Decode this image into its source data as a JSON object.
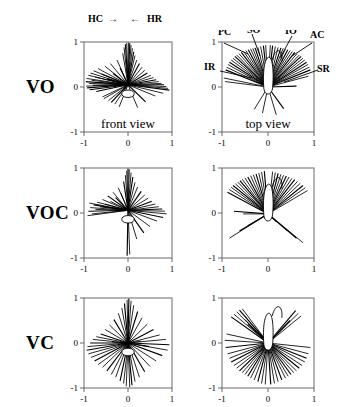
{
  "figure": {
    "rows": [
      {
        "label": "VO"
      },
      {
        "label": "VOC"
      },
      {
        "label": "VC"
      }
    ],
    "view_labels": {
      "front": "front view",
      "top": "top view"
    },
    "axis": {
      "tick_min": "-1",
      "tick_mid": "0",
      "tick_max": "1",
      "range": [
        -1,
        1
      ]
    },
    "header_annotations": {
      "hc": "HC",
      "hc_arrow": "→",
      "hr_arrow": "←",
      "hr": "HR"
    },
    "top_view_annotations": {
      "pc": "PC",
      "so": "SO",
      "io": "IO",
      "ac": "AC",
      "ir": "IR",
      "sr": "SR"
    },
    "colors": {
      "line": "#000000",
      "axis": "#6b6b6b",
      "background": "#ffffff"
    }
  },
  "chart_data": {
    "type": "scatter",
    "title": "",
    "xlabel": "",
    "ylabel": "",
    "xlim": [
      -1,
      1
    ],
    "ylim": [
      -1,
      1
    ],
    "xticks": [
      -1,
      0,
      1
    ],
    "yticks": [
      -1,
      0,
      1
    ],
    "grid": false,
    "legend": "none",
    "panels": [
      {
        "row": "VO",
        "column": "front view",
        "origin": [
          0.0,
          0.05
        ],
        "annotations": [
          "HC",
          "HR"
        ],
        "vectors": [
          [
            -0.96,
            0.12
          ],
          [
            -0.95,
            0.02
          ],
          [
            -0.94,
            0.19
          ],
          [
            -0.93,
            -0.02
          ],
          [
            -0.9,
            0.26
          ],
          [
            -0.89,
            0.08
          ],
          [
            -0.87,
            -0.06
          ],
          [
            -0.85,
            0.31
          ],
          [
            -0.83,
            0.15
          ],
          [
            -0.8,
            0.04
          ],
          [
            -0.78,
            0.36
          ],
          [
            -0.75,
            0.22
          ],
          [
            -0.72,
            -0.1
          ],
          [
            -0.68,
            0.41
          ],
          [
            -0.65,
            0.1
          ],
          [
            -0.6,
            0.29
          ],
          [
            -0.58,
            -0.22
          ],
          [
            -0.52,
            0.46
          ],
          [
            -0.48,
            0.18
          ],
          [
            -0.44,
            -0.3
          ],
          [
            -0.4,
            0.52
          ],
          [
            -0.34,
            0.3
          ],
          [
            -0.3,
            -0.38
          ],
          [
            -0.25,
            0.6
          ],
          [
            -0.18,
            0.42
          ],
          [
            -0.12,
            0.75
          ],
          [
            -0.09,
            0.88
          ],
          [
            -0.06,
            0.95
          ],
          [
            -0.03,
            0.98
          ],
          [
            0.01,
            0.99
          ],
          [
            0.04,
            0.97
          ],
          [
            0.07,
            0.93
          ],
          [
            0.1,
            0.86
          ],
          [
            0.13,
            0.78
          ],
          [
            0.16,
            0.7
          ],
          [
            0.2,
            0.6
          ],
          [
            0.26,
            0.52
          ],
          [
            0.32,
            0.44
          ],
          [
            0.38,
            0.37
          ],
          [
            0.44,
            0.31
          ],
          [
            0.52,
            0.26
          ],
          [
            0.58,
            0.21
          ],
          [
            0.64,
            0.16
          ],
          [
            0.7,
            0.12
          ],
          [
            0.76,
            0.08
          ],
          [
            0.82,
            0.05
          ],
          [
            0.87,
            0.01
          ],
          [
            0.91,
            -0.03
          ],
          [
            0.94,
            -0.07
          ],
          [
            0.8,
            -0.14
          ],
          [
            0.62,
            -0.2
          ],
          [
            0.4,
            -0.33
          ],
          [
            0.22,
            -0.46
          ],
          [
            -0.2,
            -0.44
          ],
          [
            -0.38,
            -0.34
          ],
          [
            -0.55,
            -0.26
          ]
        ]
      },
      {
        "row": "VO",
        "column": "top view",
        "origin": [
          0.0,
          0.0
        ],
        "annotations": [
          "PC",
          "SO",
          "IO",
          "AC",
          "IR",
          "SR"
        ],
        "vectors": [
          [
            -0.92,
            0.38
          ],
          [
            -0.9,
            0.44
          ],
          [
            -0.87,
            0.5
          ],
          [
            -0.84,
            0.55
          ],
          [
            -0.8,
            0.6
          ],
          [
            -0.76,
            0.64
          ],
          [
            -0.72,
            0.68
          ],
          [
            -0.68,
            0.71
          ],
          [
            -0.63,
            0.74
          ],
          [
            -0.58,
            0.77
          ],
          [
            -0.53,
            0.79
          ],
          [
            -0.48,
            0.81
          ],
          [
            -0.43,
            0.83
          ],
          [
            -0.38,
            0.85
          ],
          [
            -0.33,
            0.86
          ],
          [
            -0.28,
            0.87
          ],
          [
            -0.22,
            0.88
          ],
          [
            -0.16,
            0.9
          ],
          [
            -0.1,
            0.92
          ],
          [
            -0.05,
            0.93
          ],
          [
            0.05,
            0.93
          ],
          [
            0.1,
            0.92
          ],
          [
            0.16,
            0.9
          ],
          [
            0.22,
            0.88
          ],
          [
            0.28,
            0.87
          ],
          [
            0.33,
            0.86
          ],
          [
            0.38,
            0.85
          ],
          [
            0.43,
            0.83
          ],
          [
            0.48,
            0.81
          ],
          [
            0.53,
            0.79
          ],
          [
            0.58,
            0.77
          ],
          [
            0.63,
            0.74
          ],
          [
            0.68,
            0.71
          ],
          [
            0.72,
            0.68
          ],
          [
            0.76,
            0.64
          ],
          [
            0.8,
            0.6
          ],
          [
            0.84,
            0.55
          ],
          [
            0.87,
            0.5
          ],
          [
            0.9,
            0.44
          ],
          [
            0.92,
            0.38
          ],
          [
            -0.96,
            0.2
          ],
          [
            -0.93,
            0.12
          ],
          [
            0.62,
            0.02
          ],
          [
            0.88,
            0.24
          ],
          [
            -0.3,
            -0.5
          ],
          [
            0.34,
            -0.48
          ],
          [
            0.18,
            -0.62
          ],
          [
            -0.12,
            -0.58
          ]
        ]
      },
      {
        "row": "VOC",
        "column": "front view",
        "origin": [
          0.0,
          0.06
        ],
        "annotations": [],
        "vectors": [
          [
            -0.9,
            0.04
          ],
          [
            -0.86,
            0.12
          ],
          [
            -0.82,
            -0.02
          ],
          [
            -0.78,
            0.18
          ],
          [
            -0.74,
            0.08
          ],
          [
            -0.7,
            0.24
          ],
          [
            -0.64,
            0.14
          ],
          [
            -0.58,
            0.3
          ],
          [
            -0.52,
            0.2
          ],
          [
            -0.46,
            0.38
          ],
          [
            -0.4,
            0.26
          ],
          [
            -0.34,
            0.46
          ],
          [
            -0.28,
            0.34
          ],
          [
            -0.22,
            0.56
          ],
          [
            -0.16,
            0.44
          ],
          [
            -0.1,
            0.7
          ],
          [
            -0.06,
            0.84
          ],
          [
            -0.03,
            0.94
          ],
          [
            0.0,
            0.99
          ],
          [
            0.03,
            0.97
          ],
          [
            0.07,
            0.9
          ],
          [
            0.11,
            0.8
          ],
          [
            0.16,
            0.68
          ],
          [
            0.22,
            0.58
          ],
          [
            0.3,
            0.48
          ],
          [
            0.38,
            0.4
          ],
          [
            0.46,
            0.33
          ],
          [
            0.54,
            0.26
          ],
          [
            0.62,
            0.2
          ],
          [
            0.7,
            0.14
          ],
          [
            0.78,
            0.09
          ],
          [
            0.84,
            0.04
          ],
          [
            0.88,
            -0.02
          ],
          [
            0.8,
            -0.1
          ],
          [
            0.66,
            -0.18
          ],
          [
            0.5,
            -0.3
          ],
          [
            0.36,
            -0.44
          ],
          [
            0.2,
            -0.58
          ],
          [
            0.04,
            -0.92
          ],
          [
            -0.02,
            -0.95
          ],
          [
            -0.88,
            0.22
          ],
          [
            -0.92,
            -0.06
          ]
        ]
      },
      {
        "row": "VOC",
        "column": "top view",
        "origin": [
          0.0,
          -0.02
        ],
        "annotations": [],
        "vectors": [
          [
            -0.88,
            0.46
          ],
          [
            -0.84,
            0.52
          ],
          [
            -0.8,
            0.57
          ],
          [
            -0.76,
            0.61
          ],
          [
            -0.71,
            0.65
          ],
          [
            -0.66,
            0.69
          ],
          [
            -0.61,
            0.72
          ],
          [
            -0.56,
            0.75
          ],
          [
            -0.5,
            0.78
          ],
          [
            -0.44,
            0.8
          ],
          [
            -0.38,
            0.83
          ],
          [
            -0.32,
            0.85
          ],
          [
            -0.26,
            0.87
          ],
          [
            -0.2,
            0.89
          ],
          [
            -0.14,
            0.91
          ],
          [
            -0.08,
            0.93
          ],
          [
            0.1,
            0.92
          ],
          [
            0.16,
            0.9
          ],
          [
            0.22,
            0.88
          ],
          [
            0.28,
            0.86
          ],
          [
            0.34,
            0.84
          ],
          [
            0.4,
            0.82
          ],
          [
            0.46,
            0.8
          ],
          [
            0.52,
            0.77
          ],
          [
            0.58,
            0.74
          ],
          [
            0.64,
            0.7
          ],
          [
            0.7,
            0.66
          ],
          [
            0.76,
            0.61
          ],
          [
            0.81,
            0.56
          ],
          [
            0.86,
            0.5
          ],
          [
            -0.74,
            0.04
          ],
          [
            -0.54,
            -0.02
          ],
          [
            -0.84,
            -0.56
          ],
          [
            -0.62,
            -0.4
          ],
          [
            -0.44,
            -0.28
          ],
          [
            0.42,
            -0.4
          ],
          [
            0.62,
            -0.56
          ],
          [
            0.76,
            -0.66
          ],
          [
            0.18,
            -0.2
          ]
        ]
      },
      {
        "row": "VC",
        "column": "front view",
        "origin": [
          0.0,
          0.0
        ],
        "annotations": [],
        "vectors": [
          [
            -0.94,
            -0.16
          ],
          [
            -0.92,
            -0.08
          ],
          [
            -0.9,
            -0.24
          ],
          [
            -0.86,
            0.0
          ],
          [
            -0.84,
            -0.32
          ],
          [
            -0.8,
            0.08
          ],
          [
            -0.76,
            -0.4
          ],
          [
            -0.72,
            0.14
          ],
          [
            -0.68,
            -0.48
          ],
          [
            -0.62,
            0.2
          ],
          [
            -0.58,
            -0.54
          ],
          [
            -0.52,
            0.3
          ],
          [
            -0.48,
            -0.62
          ],
          [
            -0.42,
            0.4
          ],
          [
            -0.38,
            -0.7
          ],
          [
            -0.32,
            0.52
          ],
          [
            -0.28,
            -0.76
          ],
          [
            -0.22,
            0.66
          ],
          [
            -0.18,
            -0.84
          ],
          [
            -0.14,
            0.78
          ],
          [
            -0.1,
            -0.9
          ],
          [
            -0.08,
            0.88
          ],
          [
            -0.04,
            -0.96
          ],
          [
            -0.02,
            0.96
          ],
          [
            0.02,
            0.99
          ],
          [
            0.04,
            -0.98
          ],
          [
            0.07,
            0.94
          ],
          [
            0.09,
            -0.94
          ],
          [
            0.13,
            0.84
          ],
          [
            0.16,
            -0.86
          ],
          [
            0.22,
            0.7
          ],
          [
            0.26,
            -0.76
          ],
          [
            0.32,
            0.56
          ],
          [
            0.38,
            -0.64
          ],
          [
            0.44,
            0.42
          ],
          [
            0.5,
            -0.52
          ],
          [
            0.58,
            0.3
          ],
          [
            0.64,
            -0.4
          ],
          [
            0.72,
            0.18
          ],
          [
            0.78,
            -0.28
          ],
          [
            0.86,
            0.08
          ],
          [
            0.9,
            -0.16
          ],
          [
            0.94,
            -0.04
          ],
          [
            0.3,
            0.04
          ],
          [
            -0.36,
            0.02
          ],
          [
            0.48,
            -0.08
          ]
        ]
      },
      {
        "row": "VC",
        "column": "top view",
        "origin": [
          0.0,
          0.0
        ],
        "annotations": [],
        "vectors": [
          [
            -0.8,
            0.58
          ],
          [
            -0.74,
            0.64
          ],
          [
            -0.68,
            0.69
          ],
          [
            -0.62,
            0.73
          ],
          [
            -0.56,
            0.76
          ],
          [
            -0.5,
            0.52
          ],
          [
            -0.44,
            0.42
          ],
          [
            -0.9,
            0.2
          ],
          [
            -0.94,
            0.06
          ],
          [
            -0.92,
            -0.1
          ],
          [
            -0.88,
            -0.24
          ],
          [
            -0.84,
            -0.34
          ],
          [
            -0.8,
            -0.42
          ],
          [
            -0.74,
            -0.5
          ],
          [
            -0.68,
            -0.56
          ],
          [
            -0.62,
            -0.62
          ],
          [
            -0.56,
            -0.66
          ],
          [
            -0.5,
            -0.7
          ],
          [
            -0.44,
            -0.74
          ],
          [
            -0.38,
            -0.78
          ],
          [
            -0.3,
            -0.82
          ],
          [
            -0.22,
            -0.86
          ],
          [
            -0.14,
            -0.9
          ],
          [
            -0.06,
            -0.92
          ],
          [
            0.06,
            -0.92
          ],
          [
            0.14,
            -0.9
          ],
          [
            0.22,
            -0.86
          ],
          [
            0.3,
            -0.82
          ],
          [
            0.38,
            -0.78
          ],
          [
            0.44,
            -0.74
          ],
          [
            0.5,
            -0.7
          ],
          [
            0.56,
            -0.66
          ],
          [
            0.62,
            -0.62
          ],
          [
            0.68,
            -0.56
          ],
          [
            0.74,
            -0.5
          ],
          [
            0.8,
            -0.42
          ],
          [
            0.84,
            -0.34
          ],
          [
            0.88,
            -0.24
          ],
          [
            0.92,
            -0.1
          ],
          [
            0.6,
            0.72
          ],
          [
            0.66,
            0.66
          ],
          [
            0.72,
            0.6
          ],
          [
            0.48,
            0.5
          ],
          [
            0.4,
            0.4
          ]
        ]
      }
    ]
  }
}
